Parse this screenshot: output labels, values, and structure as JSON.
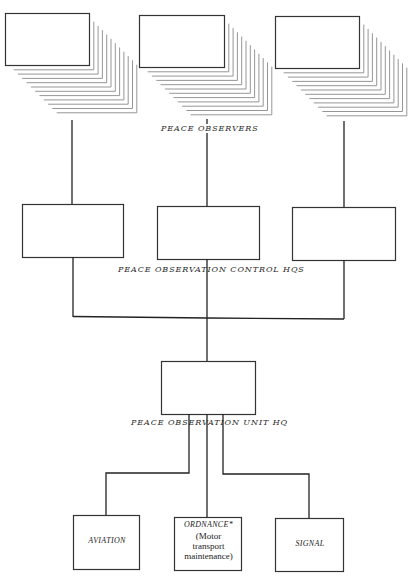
{
  "diagram": {
    "type": "organization-chart",
    "levels": {
      "observers": {
        "label": "PEACE OBSERVERS",
        "group_count": 3,
        "note": "each group drawn as a stack of many boxes"
      },
      "control_hqs": {
        "label": "PEACE OBSERVATION CONTROL HQS",
        "count": 3
      },
      "unit_hq": {
        "label": "PEACE OBSERVATION UNIT HQ"
      },
      "support_units": [
        {
          "title": "AVIATION",
          "subtitle": ""
        },
        {
          "title": "ORDNANCE*",
          "subtitle": "(Motor transport maintenance)"
        },
        {
          "title": "SIGNAL",
          "subtitle": ""
        }
      ]
    },
    "ordnance_sub_lines": [
      "(Motor",
      "transport",
      "maintenance)"
    ],
    "colors": {
      "line": "#222222",
      "shadow_line": "#8a8a8a",
      "background": "#ffffff"
    }
  }
}
